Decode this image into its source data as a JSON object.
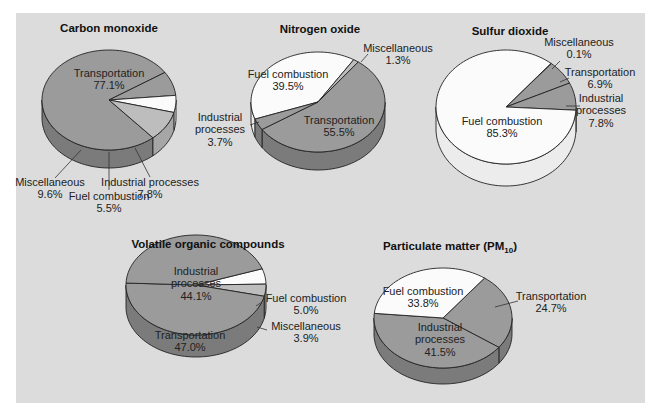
{
  "colors": {
    "panel": "#dcdcdc",
    "dark_gray": "#9b9b9b",
    "light_gray": "#bdbdbd",
    "white": "#fbfbfb",
    "side_dark": "#7b7b7b",
    "side_light": "#a6a6a6",
    "side_white": "#ececec"
  },
  "chart_data": [
    {
      "type": "pie",
      "title": "Carbon monoxide",
      "slices": [
        {
          "label": "Transportation",
          "value": 77.1,
          "value_text": "77.1%",
          "shade": "dark_gray"
        },
        {
          "label": "Industrial processes",
          "value": 7.8,
          "value_text": "7.8%",
          "shade": "dark_gray"
        },
        {
          "label": "Fuel combustion",
          "value": 5.5,
          "value_text": "5.5%",
          "shade": "white"
        },
        {
          "label": "Miscellaneous",
          "value": 9.6,
          "value_text": "9.6%",
          "shade": "light_gray"
        }
      ]
    },
    {
      "type": "pie",
      "title": "Nitrogen oxide",
      "slices": [
        {
          "label": "Fuel combustion",
          "value": 39.5,
          "value_text": "39.5%",
          "shade": "white"
        },
        {
          "label": "Miscellaneous",
          "value": 1.3,
          "value_text": "1.3%",
          "shade": "light_gray"
        },
        {
          "label": "Transportation",
          "value": 55.5,
          "value_text": "55.5%",
          "shade": "dark_gray"
        },
        {
          "label": "Industrial processes",
          "value": 3.7,
          "value_text": "3.7%",
          "shade": "dark_gray"
        }
      ]
    },
    {
      "type": "pie",
      "title": "Sulfur dioxide",
      "slices": [
        {
          "label": "Miscellaneous",
          "value": 0.1,
          "value_text": "0.1%",
          "shade": "light_gray"
        },
        {
          "label": "Transportation",
          "value": 6.9,
          "value_text": "6.9%",
          "shade": "dark_gray"
        },
        {
          "label": "Industrial processes",
          "value": 7.8,
          "value_text": "7.8%",
          "shade": "dark_gray"
        },
        {
          "label": "Fuel combustion",
          "value": 85.3,
          "value_text": "85.3%",
          "shade": "white"
        }
      ]
    },
    {
      "type": "pie",
      "title": "Volatile organic compounds",
      "slices": [
        {
          "label": "Fuel combustion",
          "value": 5.0,
          "value_text": "5.0%",
          "shade": "white"
        },
        {
          "label": "Miscellaneous",
          "value": 3.9,
          "value_text": "3.9%",
          "shade": "light_gray"
        },
        {
          "label": "Transportation",
          "value": 47.0,
          "value_text": "47.0%",
          "shade": "dark_gray"
        },
        {
          "label": "Industrial processes",
          "value": 44.1,
          "value_text": "44.1%",
          "shade": "dark_gray"
        }
      ]
    },
    {
      "type": "pie",
      "title": "Particulate matter (PM10)",
      "title_main": "Particulate matter (PM",
      "title_sub": "10",
      "title_end": ")",
      "slices": [
        {
          "label": "Transportation",
          "value": 24.7,
          "value_text": "24.7%",
          "shade": "dark_gray"
        },
        {
          "label": "Industrial processes",
          "value": 41.5,
          "value_text": "41.5%",
          "shade": "dark_gray"
        },
        {
          "label": "Fuel combustion",
          "value": 33.8,
          "value_text": "33.8%",
          "shade": "white"
        }
      ]
    }
  ]
}
